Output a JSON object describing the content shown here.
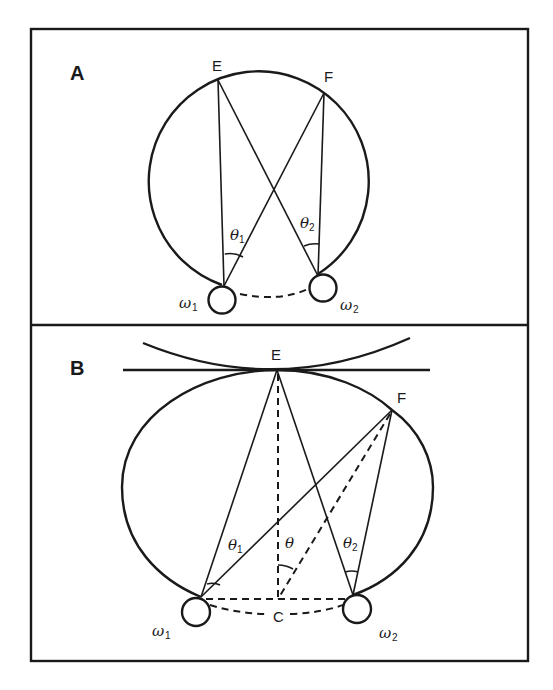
{
  "figure": {
    "panel_a": {
      "label": "A",
      "points": {
        "E": "E",
        "F": "F"
      },
      "angles": {
        "theta1": "θ",
        "theta1_sub": "1",
        "theta2": "θ",
        "theta2_sub": "2"
      },
      "sources": {
        "omega1": "ω",
        "omega1_sub": "1",
        "omega2": "ω",
        "omega2_sub": "2"
      }
    },
    "panel_b": {
      "label": "B",
      "points": {
        "E": "E",
        "F": "F",
        "C": "C"
      },
      "angles": {
        "theta": "θ",
        "theta1": "θ",
        "theta1_sub": "1",
        "theta2": "θ",
        "theta2_sub": "2"
      },
      "sources": {
        "omega1": "ω",
        "omega1_sub": "1",
        "omega2": "ω",
        "omega2_sub": "2"
      }
    },
    "colors": {
      "ink": "#1a1a1a",
      "background": "#ffffff"
    }
  }
}
